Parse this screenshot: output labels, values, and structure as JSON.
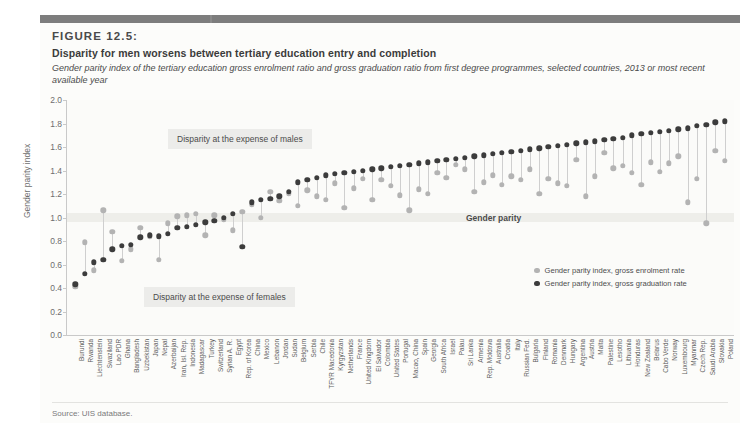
{
  "figure": {
    "label": "FIGURE 12.5:",
    "title": "Disparity for men worsens between tertiary education entry and completion",
    "subtitle": "Gender parity index of the tertiary education gross enrolment ratio and gross graduation ratio from first degree programmes, selected countries, 2013 or most recent available year",
    "source": "Source: UIS database."
  },
  "annotations": {
    "males": "Disparity at the expense of males",
    "females": "Disparity at the expense of females",
    "parity": "Gender parity"
  },
  "legend": {
    "items": [
      {
        "label": "Gender parity index, gross enrolment rate",
        "color": "#b3b3b3"
      },
      {
        "label": "Gender parity index, gross graduation rate",
        "color": "#3c3c3c"
      }
    ]
  },
  "colors": {
    "enrolment": "#b3b3b3",
    "graduation": "#3c3c3c",
    "stem": "#cfcfcf",
    "parity_band": "#eeeeea",
    "header_bar": "#8a8a8a"
  },
  "chart_data": {
    "type": "scatter",
    "title": "Disparity for men worsens between tertiary education entry and completion",
    "xlabel": "",
    "ylabel": "Gender parity index",
    "ylim": [
      0.0,
      2.0
    ],
    "yticks": [
      "0.0",
      "0.2",
      "0.4",
      "0.6",
      "0.8",
      "1.0",
      "1.2",
      "1.4",
      "1.6",
      "1.8",
      "2.0"
    ],
    "grid": false,
    "legend_position": "inside-right",
    "parity_line": 1.0,
    "categories": [
      "Burundi",
      "Rwanda",
      "Liechtenstein",
      "Swaziland",
      "Lao PDR",
      "Ghana",
      "Bangladesh",
      "Uzbekistan",
      "Japan",
      "Nepal",
      "Azerbaijan",
      "Iran, Isl. Rep.",
      "Indonesia",
      "Madagascar",
      "Turkey",
      "Switzerland",
      "Syrian A. R.",
      "Egypt",
      "Rep. of Korea",
      "China",
      "Mexico",
      "Lebanon",
      "Jordan",
      "Sudan",
      "Belgium",
      "Serbia",
      "Chile",
      "TFYR Macedonia",
      "Kyrgyzstan",
      "Netherlands",
      "France",
      "United Kingdom",
      "El Salvador",
      "Colombia",
      "United States",
      "Portugal",
      "Macao, China",
      "Spain",
      "Georgia",
      "South Africa",
      "Israel",
      "Palau",
      "Sri Lanka",
      "Armenia",
      "Rep. Moldova",
      "Australia",
      "Croatia",
      "Italy",
      "Russian Fed.",
      "Bulgaria",
      "Finland",
      "Romania",
      "Denmark",
      "Hungary",
      "Argentina",
      "Austria",
      "Malta",
      "Palestine",
      "Lesotho",
      "Lithuania",
      "Honduras",
      "New Zealand",
      "Belarus",
      "Cabo Verde",
      "Norway",
      "Luxembourg",
      "Myanmar",
      "Czech Rep.",
      "Saudi Arabia",
      "Slovakia",
      "Poland"
    ],
    "series": [
      {
        "name": "Gender parity index, gross enrolment rate",
        "color": "#b3b3b3",
        "values": [
          0.41,
          0.79,
          0.55,
          1.06,
          0.88,
          0.63,
          0.73,
          0.91,
          0.84,
          0.64,
          0.95,
          1.01,
          1.02,
          1.03,
          0.85,
          1.02,
          0.98,
          0.89,
          1.05,
          1.11,
          1.0,
          1.22,
          1.14,
          1.2,
          1.1,
          1.23,
          1.18,
          1.15,
          1.29,
          1.08,
          1.25,
          1.33,
          1.15,
          1.32,
          1.27,
          1.19,
          1.06,
          1.24,
          1.2,
          1.38,
          1.34,
          1.45,
          1.41,
          1.22,
          1.3,
          1.36,
          1.28,
          1.35,
          1.32,
          1.41,
          1.2,
          1.33,
          1.29,
          1.27,
          1.49,
          1.18,
          1.35,
          1.55,
          1.42,
          1.44,
          1.38,
          1.28,
          1.47,
          1.39,
          1.46,
          1.52,
          1.13,
          1.33,
          0.95,
          1.57,
          1.48
        ]
      },
      {
        "name": "Gender parity index, gross graduation rate",
        "color": "#3c3c3c",
        "values": [
          0.43,
          0.52,
          0.62,
          0.64,
          0.73,
          0.76,
          0.77,
          0.83,
          0.85,
          0.84,
          0.86,
          0.91,
          0.92,
          0.94,
          0.96,
          0.97,
          1.0,
          1.03,
          0.75,
          1.13,
          1.15,
          1.16,
          1.18,
          1.22,
          1.3,
          1.32,
          1.34,
          1.36,
          1.37,
          1.38,
          1.39,
          1.4,
          1.41,
          1.42,
          1.43,
          1.44,
          1.45,
          1.46,
          1.47,
          1.48,
          1.49,
          1.5,
          1.51,
          1.52,
          1.53,
          1.54,
          1.55,
          1.56,
          1.57,
          1.58,
          1.59,
          1.6,
          1.61,
          1.62,
          1.63,
          1.64,
          1.65,
          1.66,
          1.67,
          1.68,
          1.7,
          1.71,
          1.72,
          1.73,
          1.74,
          1.75,
          1.76,
          1.78,
          1.79,
          1.81,
          1.82
        ]
      }
    ]
  }
}
